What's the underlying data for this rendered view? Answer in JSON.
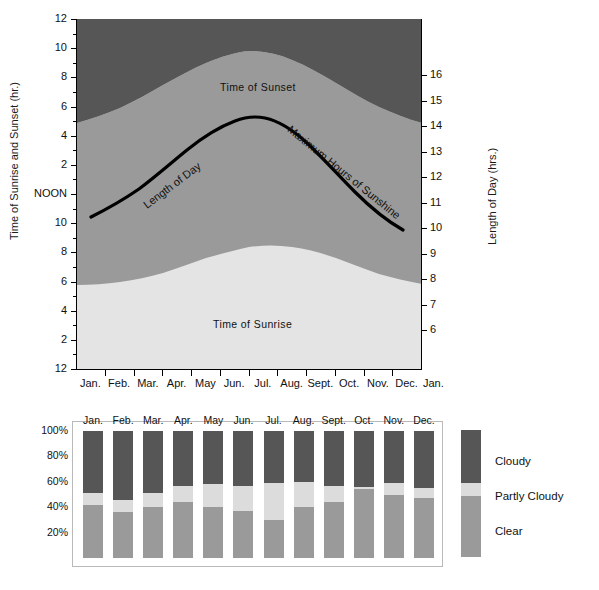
{
  "figure": {
    "background": "#ffffff",
    "colors": {
      "cloudy_dark": "#565656",
      "partly_cloudy_light": "#dcdcdc",
      "clear_mid": "#9a9a9a",
      "night_dark": "#565656",
      "day_mid": "#9a9a9a",
      "morning_light": "#e4e4e4",
      "curve": "#000000",
      "frame": "#b9b9b9"
    }
  },
  "sun_chart": {
    "left_axis": {
      "title": "Time of Sunrise and Sunset (hr.)",
      "ticks": [
        "12",
        "10",
        "8",
        "6",
        "4",
        "2",
        "NOON",
        "10",
        "8",
        "6",
        "4",
        "2",
        "12"
      ]
    },
    "right_axis": {
      "title": "Length of Day (hrs.)",
      "ticks": [
        "16",
        "15",
        "14",
        "13",
        "12",
        "11",
        "10",
        "9",
        "8",
        "7",
        "6"
      ]
    },
    "x_axis": {
      "ticks": [
        "Jan.",
        "Feb.",
        "Mar.",
        "Apr.",
        "May",
        "Jun.",
        "Jul.",
        "Aug.",
        "Sept.",
        "Oct.",
        "Nov.",
        "Dec.",
        "Jan."
      ]
    },
    "annotations": {
      "sunset": "Time of Sunset",
      "sunrise": "Time of Sunrise",
      "length_of_day": "Length of Day",
      "max_sunshine": "Maximum Hours of Sunshine"
    }
  },
  "cloud_chart": {
    "y_ticks": [
      "100%",
      "80%",
      "60%",
      "40%",
      "20%"
    ],
    "months": [
      "Jan.",
      "Feb.",
      "Mar.",
      "Apr.",
      "May",
      "Jun.",
      "Jul.",
      "Aug.",
      "Sept.",
      "Oct.",
      "Nov.",
      "Dec."
    ],
    "legend": {
      "cloudy": "Cloudy",
      "partly_cloudy": "Partly Cloudy",
      "clear": "Clear"
    }
  },
  "chart_data": [
    {
      "type": "area",
      "title": "Time of Sunrise and Sunset / Length of Day",
      "xlabel": "",
      "ylabel": "Time of Sunrise and Sunset (hr.)",
      "y2label": "Length of Day (hrs.)",
      "grid": false,
      "legend": "none",
      "x": [
        "Jan.",
        "Feb.",
        "Mar.",
        "Apr.",
        "May",
        "Jun.",
        "Jul.",
        "Aug.",
        "Sept.",
        "Oct.",
        "Nov.",
        "Dec.",
        "Jan."
      ],
      "ylim_left_ticks": [
        "12",
        "10",
        "8",
        "6",
        "4",
        "2",
        "NOON",
        "10",
        "8",
        "6",
        "4",
        "2",
        "12"
      ],
      "ylim_right": [
        5.5,
        16.5
      ],
      "series": [
        {
          "name": "Time of Sunset",
          "units": "p.m. hour",
          "values": [
            4.75,
            5.3,
            5.9,
            6.5,
            7.0,
            7.4,
            7.4,
            7.0,
            6.4,
            5.7,
            5.0,
            4.65,
            4.75
          ]
        },
        {
          "name": "Time of Sunrise",
          "units": "a.m. hour",
          "values": [
            7.05,
            6.85,
            6.4,
            5.8,
            5.2,
            4.75,
            4.75,
            5.1,
            5.6,
            6.15,
            6.7,
            7.05,
            7.05
          ]
        },
        {
          "name": "Maximum Hours of Sunshine (Length of Day)",
          "units": "hours",
          "values": [
            9.7,
            10.4,
            11.5,
            12.7,
            13.8,
            14.45,
            14.4,
            13.6,
            12.5,
            11.3,
            10.3,
            9.6,
            9.7
          ]
        }
      ]
    },
    {
      "type": "bar",
      "subtype": "stacked-100-percent",
      "title": "Sky Cover by Month",
      "xlabel": "",
      "ylabel": "Percent of days",
      "ylim": [
        0,
        100
      ],
      "yticks": [
        20,
        40,
        60,
        80,
        100
      ],
      "grid": false,
      "legend": "right",
      "categories": [
        "Jan.",
        "Feb.",
        "Mar.",
        "Apr.",
        "May",
        "Jun.",
        "Jul.",
        "Aug.",
        "Sept.",
        "Oct.",
        "Nov.",
        "Dec."
      ],
      "series": [
        {
          "name": "Clear",
          "values": [
            42,
            36,
            40,
            44,
            40,
            37,
            30,
            40,
            44,
            54,
            50,
            47
          ]
        },
        {
          "name": "Partly Cloudy",
          "values": [
            9,
            10,
            11,
            13,
            18,
            20,
            29,
            20,
            13,
            2,
            9,
            8
          ]
        },
        {
          "name": "Cloudy",
          "values": [
            49,
            54,
            49,
            43,
            42,
            43,
            41,
            40,
            43,
            44,
            41,
            45
          ]
        }
      ],
      "legend_key_bar": {
        "clear": 48,
        "partly_cloudy": 10,
        "cloudy": 42
      }
    }
  ]
}
